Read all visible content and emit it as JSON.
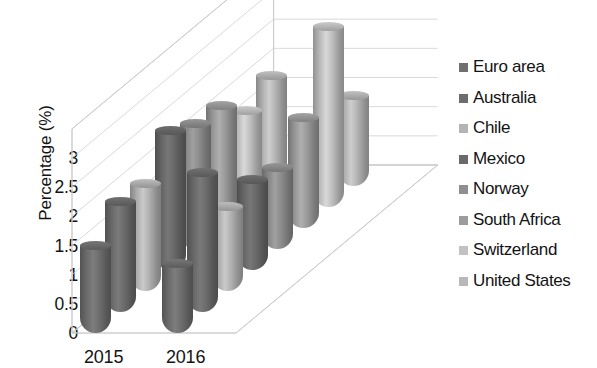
{
  "chart_data": {
    "type": "bar",
    "subtype": "3d-cylinder-clustered",
    "title": "",
    "xlabel": "",
    "ylabel": "Percentage (%)",
    "categories": [
      "2015",
      "2016"
    ],
    "ylim": [
      0,
      3.5
    ],
    "yticks": [
      "0",
      "0.5",
      "1",
      "1.5",
      "2",
      "2.5",
      "3"
    ],
    "ytick_values": [
      0,
      0.5,
      1,
      1.5,
      2,
      2.5,
      3
    ],
    "grid": true,
    "legend_position": "right",
    "series": [
      {
        "name": "Euro area",
        "color": "#707070",
        "values": [
          1.5,
          1.2
        ]
      },
      {
        "name": "Australia",
        "color": "#6d6d6d",
        "values": [
          1.9,
          2.4
        ]
      },
      {
        "name": "Chile",
        "color": "#b4b4b4",
        "values": [
          1.85,
          1.45
        ]
      },
      {
        "name": "Mexico",
        "color": "#6a6a6a",
        "values": [
          2.4,
          1.55
        ]
      },
      {
        "name": "Norway",
        "color": "#8f8f8f",
        "values": [
          2.15,
          1.4
        ]
      },
      {
        "name": "South Africa",
        "color": "#9c9c9c",
        "values": [
          2.1,
          1.9
        ]
      },
      {
        "name": "Switzerland",
        "color": "#c2c2c2",
        "values": [
          1.65,
          3.1
        ]
      },
      {
        "name": "United States",
        "color": "#b8b8b8",
        "values": [
          1.9,
          1.55
        ]
      }
    ]
  },
  "legend": {
    "items": [
      {
        "label": "Euro area"
      },
      {
        "label": "Australia"
      },
      {
        "label": "Chile"
      },
      {
        "label": "Mexico"
      },
      {
        "label": "Norway"
      },
      {
        "label": "South Africa"
      },
      {
        "label": "Switzerland"
      },
      {
        "label": "United States"
      }
    ]
  },
  "axes": {
    "y_title": "Percentage (%)",
    "y_ticks": [
      "3",
      "2.5",
      "2",
      "1.5",
      "1",
      "0.5",
      "0"
    ],
    "x_ticks": [
      "2015",
      "2016"
    ]
  },
  "colors": {
    "grid": "#cfcfcf",
    "wireframe": "#c9c9c9",
    "text": "#131313",
    "background": "#ffffff"
  }
}
